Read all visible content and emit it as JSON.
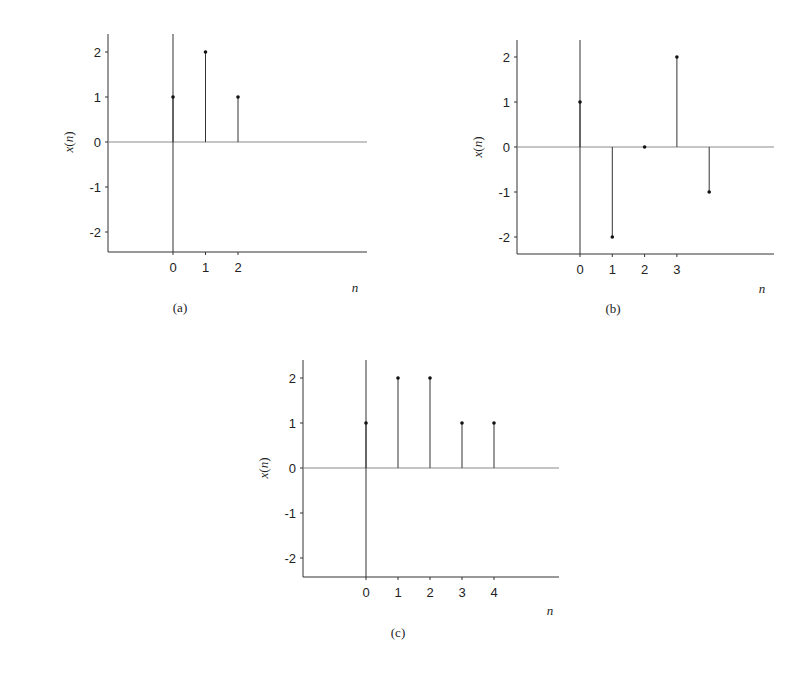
{
  "chart_data": [
    {
      "type": "stem",
      "caption": "(a)",
      "xlabel": "n",
      "ylabel": "x(n)",
      "ylim": [
        -2.4,
        2.4
      ],
      "yticks": [
        "2",
        "1",
        "0",
        "-1",
        "-2"
      ],
      "xtick_labels": [
        "0",
        "1",
        "2"
      ],
      "x": [
        0,
        1,
        2
      ],
      "values": [
        1,
        2,
        1
      ],
      "grid": false,
      "geom": {
        "left": 108,
        "right": 367,
        "top": 34,
        "bottom": 252,
        "x0": 173,
        "dx": 32.5,
        "y0": 142,
        "dy": 45,
        "xticks": 3,
        "nlx": 355,
        "nly": 292,
        "capx": 180,
        "capy": 312
      }
    },
    {
      "type": "stem",
      "caption": "(b)",
      "xlabel": "n",
      "ylabel": "x(n)",
      "ylim": [
        -2.4,
        2.4
      ],
      "yticks": [
        "2",
        "1",
        "0",
        "-1",
        "-2"
      ],
      "xtick_labels": [
        "0",
        "1",
        "2",
        "3"
      ],
      "x": [
        0,
        1,
        2,
        3,
        4
      ],
      "values": [
        1,
        -2,
        0,
        2,
        -1
      ],
      "grid": false,
      "geom": {
        "left": 517,
        "right": 774,
        "top": 40,
        "bottom": 254,
        "x0": 580,
        "dx": 32.3,
        "y0": 147,
        "dy": 45,
        "xticks": 4,
        "nlx": 762,
        "nly": 293,
        "capx": 613,
        "capy": 313
      }
    },
    {
      "type": "stem",
      "caption": "(c)",
      "xlabel": "n",
      "ylabel": "x(n)",
      "ylim": [
        -2.4,
        2.4
      ],
      "yticks": [
        "2",
        "1",
        "0",
        "-1",
        "-2"
      ],
      "xtick_labels": [
        "0",
        "1",
        "2",
        "3",
        "4"
      ],
      "x": [
        0,
        1,
        2,
        3,
        4
      ],
      "values": [
        1,
        2,
        2,
        1,
        1
      ],
      "grid": false,
      "geom": {
        "left": 303,
        "right": 559,
        "top": 360,
        "bottom": 577,
        "x0": 366,
        "dx": 32,
        "y0": 468,
        "dy": 45,
        "xticks": 5,
        "nlx": 550,
        "nly": 615,
        "capx": 398,
        "capy": 637
      }
    }
  ]
}
